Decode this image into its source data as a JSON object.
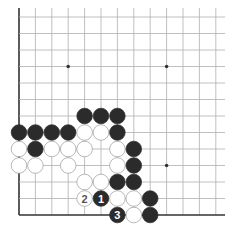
{
  "board": {
    "columns": 13,
    "rows": 13,
    "origin_x": 19,
    "origin_y": 17,
    "spacing_x": 16.4,
    "spacing_y": 16.5,
    "edges": {
      "left": true,
      "bottom": true,
      "top": false,
      "right": false
    },
    "line_color": "#b0b0b0",
    "edge_color": "#333333",
    "star_points": [
      [
        3,
        3
      ],
      [
        9,
        3
      ],
      [
        9,
        9
      ]
    ]
  },
  "colors": {
    "black_stone": "#2b2b2b",
    "white_stone": "#ffffff",
    "white_stroke": "#9a9a9a",
    "black_label": "#ffffff",
    "white_label": "#555555"
  },
  "stones": [
    {
      "c": 4,
      "r": 6,
      "color": "black"
    },
    {
      "c": 5,
      "r": 6,
      "color": "black"
    },
    {
      "c": 6,
      "r": 6,
      "color": "black"
    },
    {
      "c": 0,
      "r": 7,
      "color": "black"
    },
    {
      "c": 1,
      "r": 7,
      "color": "black"
    },
    {
      "c": 2,
      "r": 7,
      "color": "black"
    },
    {
      "c": 3,
      "r": 7,
      "color": "black"
    },
    {
      "c": 4,
      "r": 7,
      "color": "white"
    },
    {
      "c": 5,
      "r": 7,
      "color": "white"
    },
    {
      "c": 6,
      "r": 7,
      "color": "black"
    },
    {
      "c": 0,
      "r": 8,
      "color": "white"
    },
    {
      "c": 1,
      "r": 8,
      "color": "black"
    },
    {
      "c": 2,
      "r": 8,
      "color": "white"
    },
    {
      "c": 3,
      "r": 8,
      "color": "white"
    },
    {
      "c": 4,
      "r": 8,
      "color": "white"
    },
    {
      "c": 6,
      "r": 8,
      "color": "white"
    },
    {
      "c": 7,
      "r": 8,
      "color": "black"
    },
    {
      "c": 0,
      "r": 9,
      "color": "white"
    },
    {
      "c": 1,
      "r": 9,
      "color": "white"
    },
    {
      "c": 3,
      "r": 9,
      "color": "white"
    },
    {
      "c": 6,
      "r": 9,
      "color": "white"
    },
    {
      "c": 7,
      "r": 9,
      "color": "black"
    },
    {
      "c": 4,
      "r": 10,
      "color": "white"
    },
    {
      "c": 5,
      "r": 10,
      "color": "white"
    },
    {
      "c": 6,
      "r": 10,
      "color": "black"
    },
    {
      "c": 7,
      "r": 10,
      "color": "black"
    },
    {
      "c": 4,
      "r": 11,
      "color": "white",
      "label": "2"
    },
    {
      "c": 5,
      "r": 11,
      "color": "black",
      "label": "1"
    },
    {
      "c": 6,
      "r": 11,
      "color": "white"
    },
    {
      "c": 7,
      "r": 11,
      "color": "white"
    },
    {
      "c": 8,
      "r": 11,
      "color": "black"
    },
    {
      "c": 6,
      "r": 12,
      "color": "black",
      "label": "3"
    },
    {
      "c": 7,
      "r": 12,
      "color": "white"
    },
    {
      "c": 8,
      "r": 12,
      "color": "black"
    }
  ]
}
